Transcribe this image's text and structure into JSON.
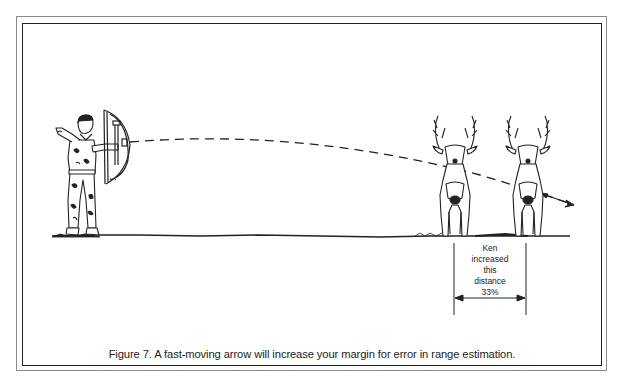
{
  "figure": {
    "caption": "Figure 7.  A fast-moving arrow will increase your margin for error in range estimation.",
    "annotation": {
      "lines": [
        "Ken",
        "increased",
        "this",
        "distance",
        "33%"
      ]
    },
    "elements": {
      "archer": "archer-drawing-bow",
      "targets": [
        "deer-near",
        "deer-far"
      ],
      "trajectory": "dashed-arrow-path",
      "measure": "distance-dimension-arrow"
    },
    "colors": {
      "ink": "#222222",
      "paper": "#ffffff",
      "outer_border": "#8a8a8a"
    }
  }
}
